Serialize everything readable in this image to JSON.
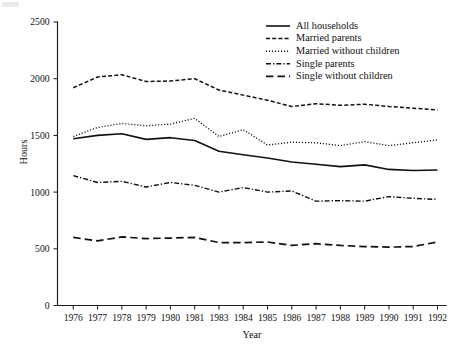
{
  "chart_data": {
    "type": "line",
    "title": "",
    "xlabel": "Year",
    "ylabel": "Hours",
    "categories": [
      "1976",
      "1977",
      "1978",
      "1979",
      "1980",
      "1981",
      "1983",
      "1984",
      "1985",
      "1986",
      "1987",
      "1988",
      "1989",
      "1990",
      "1991",
      "1992"
    ],
    "ylim": [
      0,
      2500
    ],
    "yticks": [
      0,
      500,
      1000,
      1500,
      2000,
      2500
    ],
    "ytick_labels": [
      "0",
      "500",
      "1000",
      "1500",
      "2000",
      "2500"
    ],
    "grid": false,
    "legend_position": "top-right",
    "series": [
      {
        "name": "All households",
        "style": "solid",
        "values": [
          1470,
          1500,
          1515,
          1465,
          1480,
          1455,
          1360,
          1330,
          1300,
          1265,
          1245,
          1225,
          1240,
          1200,
          1190,
          1195
        ]
      },
      {
        "name": "Married parents",
        "style": "dashed-short",
        "values": [
          1920,
          2015,
          2035,
          1975,
          1980,
          2000,
          1900,
          1855,
          1810,
          1755,
          1780,
          1765,
          1775,
          1755,
          1740,
          1725
        ]
      },
      {
        "name": "Married without children",
        "style": "dotted",
        "values": [
          1490,
          1570,
          1605,
          1585,
          1600,
          1650,
          1490,
          1550,
          1415,
          1440,
          1435,
          1410,
          1445,
          1410,
          1435,
          1460
        ]
      },
      {
        "name": "Single parents",
        "style": "dash-dot",
        "values": [
          1145,
          1085,
          1095,
          1045,
          1085,
          1060,
          1000,
          1040,
          1000,
          1010,
          920,
          925,
          920,
          960,
          945,
          935
        ]
      },
      {
        "name": "Single without children",
        "style": "dashed-long",
        "values": [
          600,
          570,
          605,
          590,
          595,
          600,
          555,
          555,
          560,
          530,
          545,
          530,
          520,
          515,
          520,
          560
        ]
      }
    ],
    "legend_entries": [
      {
        "label": "All households",
        "style": "solid"
      },
      {
        "label": "Married parents",
        "style": "dashed-short"
      },
      {
        "label": "Married without children",
        "style": "dotted"
      },
      {
        "label": "Single parents",
        "style": "dash-dot"
      },
      {
        "label": "Single without children",
        "style": "dashed-long"
      }
    ]
  }
}
